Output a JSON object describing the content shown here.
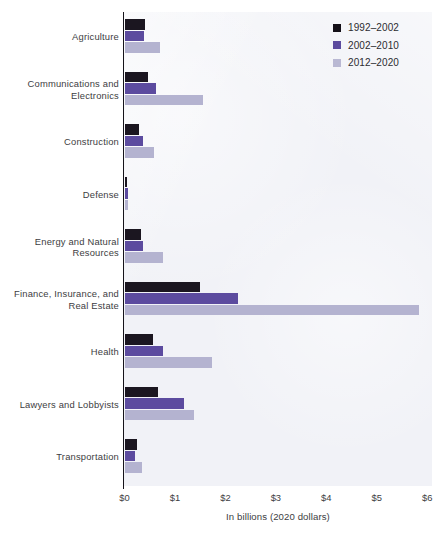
{
  "chart_data": {
    "type": "bar",
    "orientation": "horizontal",
    "title": "",
    "xlabel": "In billions (2020 dollars)",
    "ylabel": "",
    "xlim": [
      0,
      6.1
    ],
    "xticks": [
      "$0",
      "$1",
      "$2",
      "$3",
      "$4",
      "$5",
      "$6"
    ],
    "xtick_values": [
      0,
      1,
      2,
      3,
      4,
      5,
      6
    ],
    "grid": false,
    "legend_position": "top-right",
    "categories": [
      "Agriculture",
      "Communications and Electronics",
      "Construction",
      "Defense",
      "Energy and Natural Resources",
      "Finance, Insurance, and Real Estate",
      "Health",
      "Lawyers and Lobbyists",
      "Transportation"
    ],
    "category_lines": [
      [
        "Agriculture"
      ],
      [
        "Communications and",
        "Electronics"
      ],
      [
        "Construction"
      ],
      [
        "Defense"
      ],
      [
        "Energy and Natural",
        "Resources"
      ],
      [
        "Finance, Insurance, and",
        "Real Estate"
      ],
      [
        "Health"
      ],
      [
        "Lawyers and Lobbyists"
      ],
      [
        "Transportation"
      ]
    ],
    "series": [
      {
        "name": "1992–2002",
        "color": "#1b1620",
        "values": [
          0.4,
          0.47,
          0.28,
          0.04,
          0.33,
          1.5,
          0.56,
          0.66,
          0.25
        ]
      },
      {
        "name": "2002–2010",
        "color": "#5c4b9f",
        "values": [
          0.38,
          0.63,
          0.36,
          0.07,
          0.37,
          2.25,
          0.77,
          1.17,
          0.21
        ]
      },
      {
        "name": "2012–2020",
        "color": "#b4b3d0",
        "values": [
          0.71,
          1.56,
          0.58,
          0.07,
          0.76,
          5.84,
          1.73,
          1.38,
          0.35
        ]
      }
    ],
    "colors": {
      "series_1992_2002": "#1b1620",
      "series_2002_2010": "#5c4b9f",
      "series_2012_2020": "#b4b3d0",
      "plot_background": "#f1f2f7",
      "axis": "#15131a",
      "text": "#3d3d42"
    }
  }
}
